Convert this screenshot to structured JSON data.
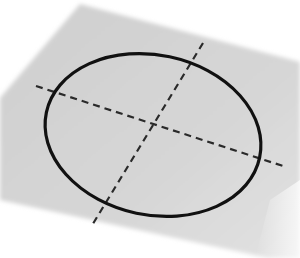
{
  "scene": {
    "description": "Circle with dashed center crosshair on a tilted gray plane",
    "background_color": "#ffffff",
    "plane_color": "#d4d4d4",
    "stroke_color": "#111111",
    "dash_color": "#2a2a2a"
  }
}
